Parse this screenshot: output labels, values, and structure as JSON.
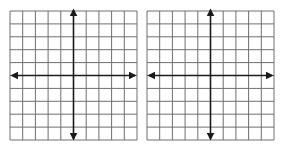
{
  "figure": {
    "grid_line_color": "#6e6e6e",
    "axis_color": "#1a1a1a",
    "background": "#ffffff",
    "planes": [
      {
        "id": "left",
        "x": 10,
        "y": 11,
        "width": 127,
        "height": 129,
        "cols": 10,
        "rows": 10,
        "axis_col": 5,
        "axis_row": 5
      },
      {
        "id": "right",
        "x": 147,
        "y": 11,
        "width": 127,
        "height": 129,
        "cols": 10,
        "rows": 10,
        "axis_col": 5,
        "axis_row": 5
      }
    ]
  }
}
